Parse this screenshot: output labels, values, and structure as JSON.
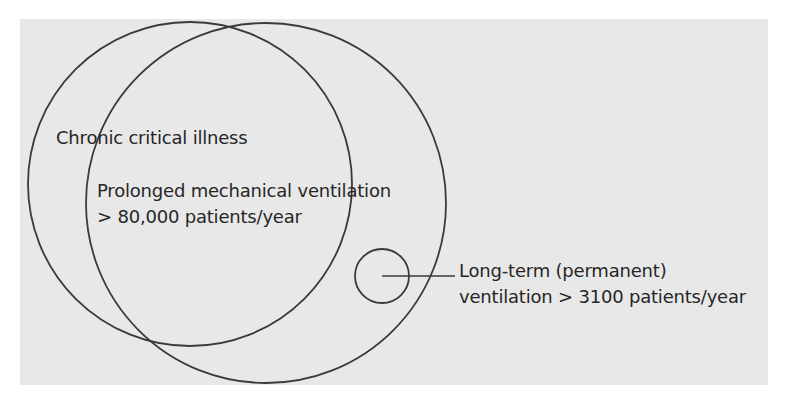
{
  "diagram": {
    "type": "nested-venn",
    "colors": {
      "panel_background": "#e8e8e8",
      "stroke": "#3a3a3a",
      "text": "#262626"
    },
    "sets": [
      {
        "id": "chronic-critical-illness",
        "label_lines": [
          "Chronic critical illness"
        ]
      },
      {
        "id": "prolonged-mechanical-ventilation",
        "label_lines": [
          "Prolonged mechanical ventilation",
          "> 80,000 patients/year"
        ]
      },
      {
        "id": "long-term-ventilation",
        "label_lines": [
          "Long-term (permanent)",
          "ventilation > 3100 patients/year"
        ]
      }
    ]
  }
}
